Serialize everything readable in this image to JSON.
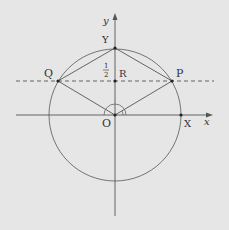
{
  "diagram": {
    "background": "#e6e6e6",
    "stroke_color": "#555555",
    "labels": {
      "y_axis": "y",
      "x_axis": "x",
      "Y": "Y",
      "Q": "Q",
      "P": "P",
      "R": "R",
      "O": "O",
      "X": "X",
      "half_num": "1",
      "half_den": "2"
    }
  }
}
